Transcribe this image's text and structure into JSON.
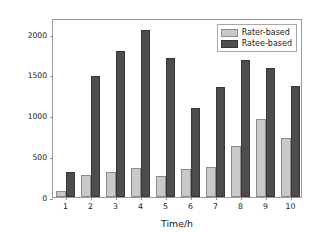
{
  "chart_data": {
    "type": "bar",
    "title": "",
    "xlabel": "Time/h",
    "ylabel": "Transaction number growth",
    "categories": [
      "1",
      "2",
      "3",
      "4",
      "5",
      "6",
      "7",
      "8",
      "9",
      "10"
    ],
    "series": [
      {
        "name": "Rater-based",
        "color": "#c9c9c9",
        "values": [
          75,
          265,
          305,
          360,
          255,
          345,
          375,
          630,
          960,
          720
        ]
      },
      {
        "name": "Ratee-based",
        "color": "#4d4d4d",
        "values": [
          305,
          1485,
          1795,
          2050,
          1705,
          1100,
          1350,
          1685,
          1580,
          1370
        ]
      }
    ],
    "ylim": [
      0,
      2200
    ],
    "yticks": [
      0,
      500,
      1000,
      1500,
      2000
    ],
    "ytick_labels": [
      "0",
      "500",
      "1000",
      "1500",
      "2000"
    ],
    "xlim": [
      0,
      10
    ],
    "grid": false,
    "legend_position": "upper right"
  }
}
